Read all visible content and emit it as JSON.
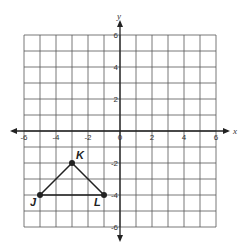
{
  "figure": {
    "type": "coordinate-plane",
    "x_axis": {
      "label": "x",
      "min": -6,
      "max": 6,
      "tick_labels": [
        "-6",
        "-4",
        "-2",
        "0",
        "2",
        "4",
        "6"
      ],
      "tick_values": [
        -6,
        -4,
        -2,
        0,
        2,
        4,
        6
      ]
    },
    "y_axis": {
      "label": "y",
      "min": -6,
      "max": 6,
      "tick_labels": [
        "6",
        "4",
        "2",
        "-2",
        "-4",
        "-6"
      ],
      "tick_values": [
        6,
        4,
        2,
        -2,
        -4,
        -6
      ]
    },
    "grid": {
      "step": 1,
      "color": "#555555"
    },
    "triangle": {
      "vertices": [
        {
          "name": "J",
          "x": -5,
          "y": -4
        },
        {
          "name": "K",
          "x": -3,
          "y": -2
        },
        {
          "name": "L",
          "x": -1,
          "y": -4
        }
      ],
      "color": "#222222"
    }
  }
}
